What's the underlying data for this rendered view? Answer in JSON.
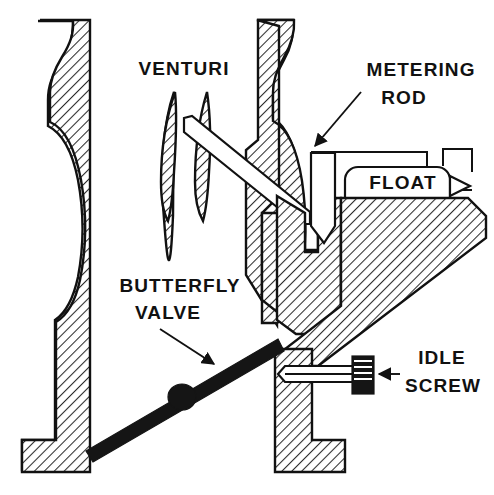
{
  "figure": {
    "domain_type": "technical-line-diagram",
    "width": 494,
    "height": 495,
    "background_color": "#ffffff",
    "ink_color": "#111111",
    "hatch_color": "#2b2b2b",
    "hatch_angle_degrees": 45,
    "hatch_description": "45-degree diagonal section hatching indicating cut metal"
  },
  "labels": {
    "venturi": "VENTURI",
    "metering_rod_line1": "METERING",
    "metering_rod_line2": "ROD",
    "float": "FLOAT",
    "butterfly_valve_line1": "BUTTERFLY",
    "butterfly_valve_line2": "VALVE",
    "idle_screw_line1": "IDLE",
    "idle_screw_line2": "SCREW"
  },
  "parts": [
    {
      "id": "left-body-wall",
      "name": "left carburetor body wall",
      "hatched": true,
      "note": "Tall sectioned wall with bulged venturi profile and L-shaped foot at bottom"
    },
    {
      "id": "venturi-vane-left",
      "name": "left venturi vane",
      "hatched": true,
      "note": "Slim lens / airfoil shaped section"
    },
    {
      "id": "venturi-vane-right",
      "name": "right venturi vane",
      "hatched": true,
      "note": "Slim lens / airfoil shaped section behind the nozzle tube"
    },
    {
      "id": "nozzle-tube",
      "name": "discharge nozzle tube",
      "hatched": false,
      "note": "White outlined slender tube angled down to the right toward the main body"
    },
    {
      "id": "right-body-wall",
      "name": "right carburetor body wall",
      "hatched": true,
      "note": "Sectioned wall with bulged venturi profile, throat and L-shaped foot"
    },
    {
      "id": "metering-rod",
      "name": "metering rod and jet",
      "hatched": false,
      "note": "Vertical white pencil-shaped rod with pointed tip in the jet passage"
    },
    {
      "id": "float",
      "name": "float",
      "hatched": false,
      "note": "Rounded rectangle in the float bowl with needle-valve arrow at right"
    },
    {
      "id": "float-bowl-body",
      "name": "float bowl body / lower casting",
      "hatched": true,
      "note": "Large triangular sectioned casting below the float chamber"
    },
    {
      "id": "butterfly-valve",
      "name": "butterfly throttle valve",
      "hatched": false,
      "note": "Solid black angled plate with central hub"
    },
    {
      "id": "idle-screw",
      "name": "idle mixture screw",
      "hatched": false,
      "note": "Horizontal tapered screw with knurled round head"
    }
  ],
  "leaders": [
    {
      "id": "metering-rod-leader",
      "from_label": "METERING ROD",
      "to_part": "metering-rod",
      "has_arrowhead": true
    },
    {
      "id": "butterfly-valve-leader",
      "from_label": "BUTTERFLY VALVE",
      "to_part": "butterfly-valve",
      "has_arrowhead": true
    },
    {
      "id": "idle-screw-leader",
      "from_label": "IDLE SCREW",
      "to_part": "idle-screw",
      "has_arrowhead": true
    }
  ]
}
